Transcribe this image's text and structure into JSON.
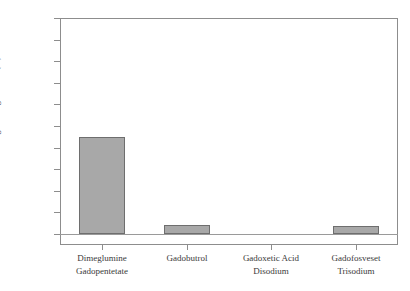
{
  "chart_data": {
    "type": "bar",
    "title": "",
    "subtitle": "",
    "xlabel": "",
    "ylabel": "Biological Degradation (%)",
    "ylim": [
      0,
      100
    ],
    "yticks": [
      0,
      10,
      20,
      30,
      40,
      50,
      60,
      70,
      80,
      90,
      100
    ],
    "ytick_labels": [
      "0",
      "10",
      "20",
      "30",
      "40",
      "50",
      "60",
      "70",
      "80",
      "90",
      "100"
    ],
    "grid": false,
    "legend": null,
    "legend_position": "none",
    "categories": [
      "Dimeglumine Gadopentetate",
      "Gadobutrol",
      "Gadoxetic Acid Disodium",
      "Gadofosveset Trisodium"
    ],
    "category_lines": [
      [
        "Dimeglumine",
        "Gadopentetate"
      ],
      [
        "Gadobutrol",
        ""
      ],
      [
        "Gadoxetic Acid",
        "Disodium"
      ],
      [
        "Gadofosveset",
        "Trisodium"
      ]
    ],
    "values": [
      45,
      4,
      0,
      3.8
    ],
    "bar_color": "#a8a8a8",
    "bar_border_color": "#6e6e6e",
    "axis_color": "#8d8d8d",
    "text_color": "#3a3a3a"
  }
}
